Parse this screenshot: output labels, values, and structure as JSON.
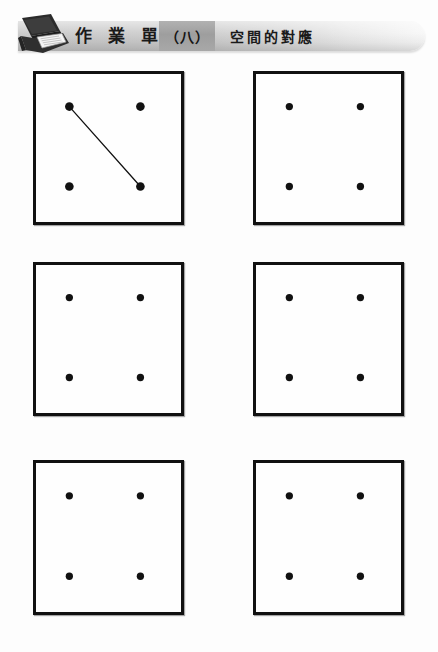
{
  "header": {
    "icon": "laptop-notebook-icon",
    "title": "作 業 單",
    "number": "（八）",
    "subtitle": "空間的對應"
  },
  "colors": {
    "ink": "#111111",
    "banner_left": "#c6c6c6",
    "banner_right": "#f7f7f7",
    "number_box": "#a8a8a8",
    "page_background": "#fdfdfd"
  },
  "grid": {
    "rows": 3,
    "columns": 2,
    "box_width": 151,
    "box_height": 154,
    "dot_radius_example": 4.5,
    "dot_radius_blank": 3.8,
    "dot_positions_pct": {
      "left_x": 23,
      "right_x": 72,
      "top_y": 22,
      "bottom_y": 76
    }
  },
  "boxes": [
    {
      "id": "box-1",
      "label": "example-box-top-left",
      "x": 33,
      "y": 71,
      "w": 151,
      "h": 154,
      "dot_radius": 4.5,
      "dots": [
        {
          "name": "dot-top-left",
          "cx": 23,
          "cy": 22
        },
        {
          "name": "dot-top-right",
          "cx": 72,
          "cy": 22
        },
        {
          "name": "dot-bottom-left",
          "cx": 23,
          "cy": 76
        },
        {
          "name": "dot-bottom-right",
          "cx": 72,
          "cy": 76
        }
      ],
      "lines": [
        {
          "name": "line-top-left-to-bottom-right",
          "x1": 23,
          "y1": 22,
          "x2": 72,
          "y2": 76
        }
      ]
    },
    {
      "id": "box-2",
      "label": "answer-box-top-right",
      "x": 253,
      "y": 71,
      "w": 151,
      "h": 154,
      "dot_radius": 3.8,
      "dots": [
        {
          "name": "dot-top-left",
          "cx": 23,
          "cy": 22
        },
        {
          "name": "dot-top-right",
          "cx": 72,
          "cy": 22
        },
        {
          "name": "dot-bottom-left",
          "cx": 23,
          "cy": 76
        },
        {
          "name": "dot-bottom-right",
          "cx": 72,
          "cy": 76
        }
      ],
      "lines": []
    },
    {
      "id": "box-3",
      "label": "answer-box-middle-left",
      "x": 33,
      "y": 262,
      "w": 151,
      "h": 154,
      "dot_radius": 3.8,
      "dots": [
        {
          "name": "dot-top-left",
          "cx": 23,
          "cy": 22
        },
        {
          "name": "dot-top-right",
          "cx": 72,
          "cy": 22
        },
        {
          "name": "dot-bottom-left",
          "cx": 23,
          "cy": 76
        },
        {
          "name": "dot-bottom-right",
          "cx": 72,
          "cy": 76
        }
      ],
      "lines": []
    },
    {
      "id": "box-4",
      "label": "answer-box-middle-right",
      "x": 253,
      "y": 262,
      "w": 151,
      "h": 154,
      "dot_radius": 3.8,
      "dots": [
        {
          "name": "dot-top-left",
          "cx": 23,
          "cy": 22
        },
        {
          "name": "dot-top-right",
          "cx": 72,
          "cy": 22
        },
        {
          "name": "dot-bottom-left",
          "cx": 23,
          "cy": 76
        },
        {
          "name": "dot-bottom-right",
          "cx": 72,
          "cy": 76
        }
      ],
      "lines": []
    },
    {
      "id": "box-5",
      "label": "answer-box-bottom-left",
      "x": 33,
      "y": 460,
      "w": 151,
      "h": 155,
      "dot_radius": 3.8,
      "dots": [
        {
          "name": "dot-top-left",
          "cx": 23,
          "cy": 22
        },
        {
          "name": "dot-top-right",
          "cx": 72,
          "cy": 22
        },
        {
          "name": "dot-bottom-left",
          "cx": 23,
          "cy": 76
        },
        {
          "name": "dot-bottom-right",
          "cx": 72,
          "cy": 76
        }
      ],
      "lines": []
    },
    {
      "id": "box-6",
      "label": "answer-box-bottom-right",
      "x": 253,
      "y": 460,
      "w": 151,
      "h": 155,
      "dot_radius": 3.8,
      "dots": [
        {
          "name": "dot-top-left",
          "cx": 23,
          "cy": 22
        },
        {
          "name": "dot-top-right",
          "cx": 72,
          "cy": 22
        },
        {
          "name": "dot-bottom-left",
          "cx": 23,
          "cy": 76
        },
        {
          "name": "dot-bottom-right",
          "cx": 72,
          "cy": 76
        }
      ],
      "lines": []
    }
  ]
}
